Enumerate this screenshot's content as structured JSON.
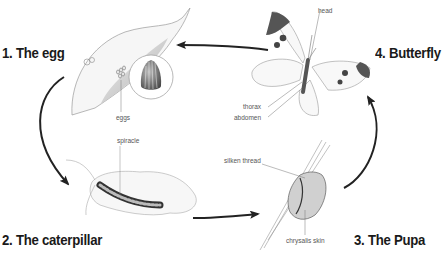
{
  "diagram": {
    "type": "life-cycle",
    "subject": "butterfly",
    "stages": [
      {
        "number": "1",
        "label": "1. The egg",
        "parts": [
          "eggs"
        ]
      },
      {
        "number": "2",
        "label": "2. The caterpillar",
        "parts": [
          "spiracle"
        ]
      },
      {
        "number": "3",
        "label": "3. The Pupa",
        "parts": [
          "silken thread",
          "chrysalis skin"
        ]
      },
      {
        "number": "4",
        "label": "4. Butterfly",
        "parts": [
          "head",
          "thorax",
          "abdomen"
        ]
      }
    ],
    "flow": [
      "1 -> 2",
      "2 -> 3",
      "3 -> 4",
      "4 -> 1"
    ]
  },
  "labels": {
    "egg": "1. The egg",
    "caterpillar": "2. The caterpillar",
    "pupa": "3. The Pupa",
    "butterfly": "4. Butterfly",
    "eggs": "eggs",
    "spiracle": "spiracle",
    "silken_thread": "silken thread",
    "chrysalis_skin": "chrysalis skin",
    "head": "head",
    "thorax": "thorax",
    "abdomen": "abdomen"
  },
  "colors": {
    "arrow": "#222222",
    "title_text": "#1a1a1a",
    "label_text": "#555555",
    "leaf_shade": "#8a8a8a",
    "wing_tip": "#555555"
  }
}
